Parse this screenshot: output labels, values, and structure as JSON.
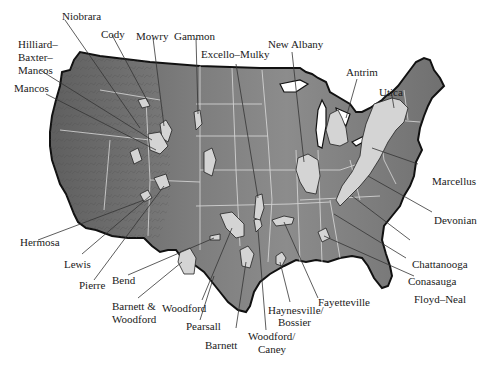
{
  "map": {
    "subject": "Shale gas plays, contiguous United States",
    "colors": {
      "background": "#ffffff",
      "land_dark": "#6e6e6e",
      "land_mid": "#8a8a8a",
      "land_light": "#a6a6a6",
      "play_fill": "#d2d2d2",
      "state_border": "#e6e6e6",
      "coast": "#111111",
      "leader_line": "#333333",
      "label_text": "#1a1a1a"
    },
    "labels": {
      "hilliard": "Hilliard–",
      "baxter": "Baxter–",
      "mancos_1": "Mancos",
      "mancos_2": "Mancos",
      "niobrara": "Niobrara",
      "cody": "Cody",
      "mowry": "Mowry",
      "gammon": "Gammon",
      "excello_mulky": "Excello–Mulky",
      "new_albany": "New Albany",
      "antrim": "Antrim",
      "utica": "Utica",
      "marcellus": "Marcellus",
      "devonian": "Devonian",
      "chattanooga": "Chattanooga",
      "conasauga": "Conasauga",
      "floyd_neal": "Floyd–Neal",
      "fayetteville": "Fayetteville",
      "haynesville_bossier_1": "Haynesville/",
      "haynesville_bossier_2": "Bossier",
      "woodford_caney_1": "Woodford/",
      "woodford_caney_2": "Caney",
      "barnett": "Barnett",
      "pearsall": "Pearsall",
      "woodford": "Woodford",
      "barnett_woodford_1": "Barnett &",
      "barnett_woodford_2": "Woodford",
      "bend": "Bend",
      "pierre": "Pierre",
      "lewis": "Lewis",
      "hermosa": "Hermosa"
    }
  }
}
